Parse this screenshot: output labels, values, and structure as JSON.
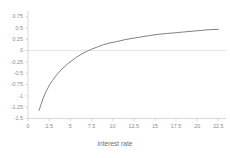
{
  "chart_data": {
    "type": "line",
    "title": "",
    "subtitle": "",
    "xlabel": "interest rate",
    "ylabel": "",
    "xlim": [
      0,
      23.4
    ],
    "ylim": [
      -1.5,
      0.875
    ],
    "grid": false,
    "zero_line": true,
    "legend": "none",
    "line_color": "#808080",
    "axis_color": "#c8c8c8",
    "tick_text_color": "#8c8c8c",
    "xticks": [
      "0",
      "2.5",
      "5",
      "7.5",
      "10",
      "12.5",
      "15",
      "17.5",
      "20",
      "22.5"
    ],
    "xtick_values": [
      0,
      2.5,
      5,
      7.5,
      10,
      12.5,
      15,
      17.5,
      20,
      22.5
    ],
    "yticks": [
      "0.75",
      "0.5",
      "0.25",
      "0",
      "-0.25",
      "-0.5",
      "-0.75",
      "-1",
      "-1.25",
      "-1.5"
    ],
    "ytick_values": [
      0.75,
      0.5,
      0.25,
      0,
      -0.25,
      -0.5,
      -0.75,
      -1,
      -1.25,
      -1.5
    ],
    "series": [
      {
        "name": "",
        "x": [
          1.3,
          1.4,
          1.5,
          1.65,
          1.8,
          2.0,
          2.2,
          2.4,
          2.6,
          2.9,
          3.2,
          3.5,
          3.9,
          4.3,
          4.7,
          5.2,
          5.7,
          6.3,
          6.9,
          7.5,
          8.2,
          8.9,
          9.7,
          10.5,
          11.4,
          12.3,
          13.3,
          14.3,
          15.4,
          16.5,
          17.7,
          18.9,
          20.1,
          21.3,
          22.5
        ],
        "y": [
          -1.32,
          -1.27,
          -1.21,
          -1.13,
          -1.05,
          -0.96,
          -0.88,
          -0.81,
          -0.74,
          -0.66,
          -0.58,
          -0.51,
          -0.43,
          -0.36,
          -0.29,
          -0.22,
          -0.15,
          -0.08,
          -0.02,
          0.03,
          0.08,
          0.13,
          0.17,
          0.2,
          0.24,
          0.27,
          0.3,
          0.33,
          0.36,
          0.38,
          0.4,
          0.42,
          0.44,
          0.46,
          0.47
        ]
      }
    ]
  }
}
